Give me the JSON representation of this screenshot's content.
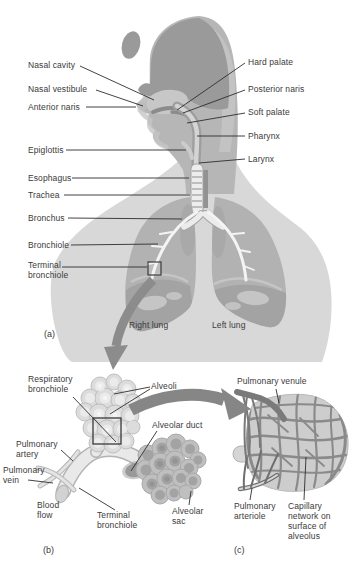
{
  "palette": {
    "label_text": "#3a3a3a",
    "leader_line": "#2e2e2e",
    "silhouette_hair": "#9a9a9a",
    "silhouette_skin": "#b6b6b6",
    "silhouette_torso": "#d8d8d8",
    "lung_gray": "#b2b2b2",
    "airway_light": "#ededed",
    "big_arrow": "#8c8c8c",
    "capillary_gray": "#8a8a8a"
  },
  "panel_a": {
    "tag": "(a)",
    "labels": {
      "nasal_cavity": "Nasal cavity",
      "nasal_vestibule": "Nasal vestibule",
      "anterior_naris": "Anterior naris",
      "epiglottis": "Epiglottis",
      "esophagus": "Esophagus",
      "trachea": "Trachea",
      "bronchus": "Bronchus",
      "bronchiole": "Bronchiole",
      "terminal_bronchiole": "Terminal\nbronchiole",
      "hard_palate": "Hard palate",
      "posterior_naris": "Posterior naris",
      "soft_palate": "Soft palate",
      "pharynx": "Pharynx",
      "larynx": "Larynx",
      "right_lung": "Right lung",
      "left_lung": "Left lung"
    }
  },
  "panel_b": {
    "tag": "(b)",
    "labels": {
      "respiratory_bronchiole": "Respiratory\nbronchiole",
      "alveoli": "Alveoli",
      "alveolar_duct": "Alveolar duct",
      "pulmonary_artery": "Pulmonary\nartery",
      "pulmonary_vein": "Pulmonary\nvein",
      "blood_flow": "Blood\nflow",
      "terminal_bronchiole": "Terminal\nbronchiole",
      "alveolar_sac": "Alveolar\nsac"
    }
  },
  "panel_c": {
    "tag": "(c)",
    "labels": {
      "pulmonary_venule": "Pulmonary venule",
      "pulmonary_arteriole": "Pulmonary\narteriole",
      "capillary_network": "Capillary\nnetwork on\nsurface of\nalveolus"
    }
  }
}
